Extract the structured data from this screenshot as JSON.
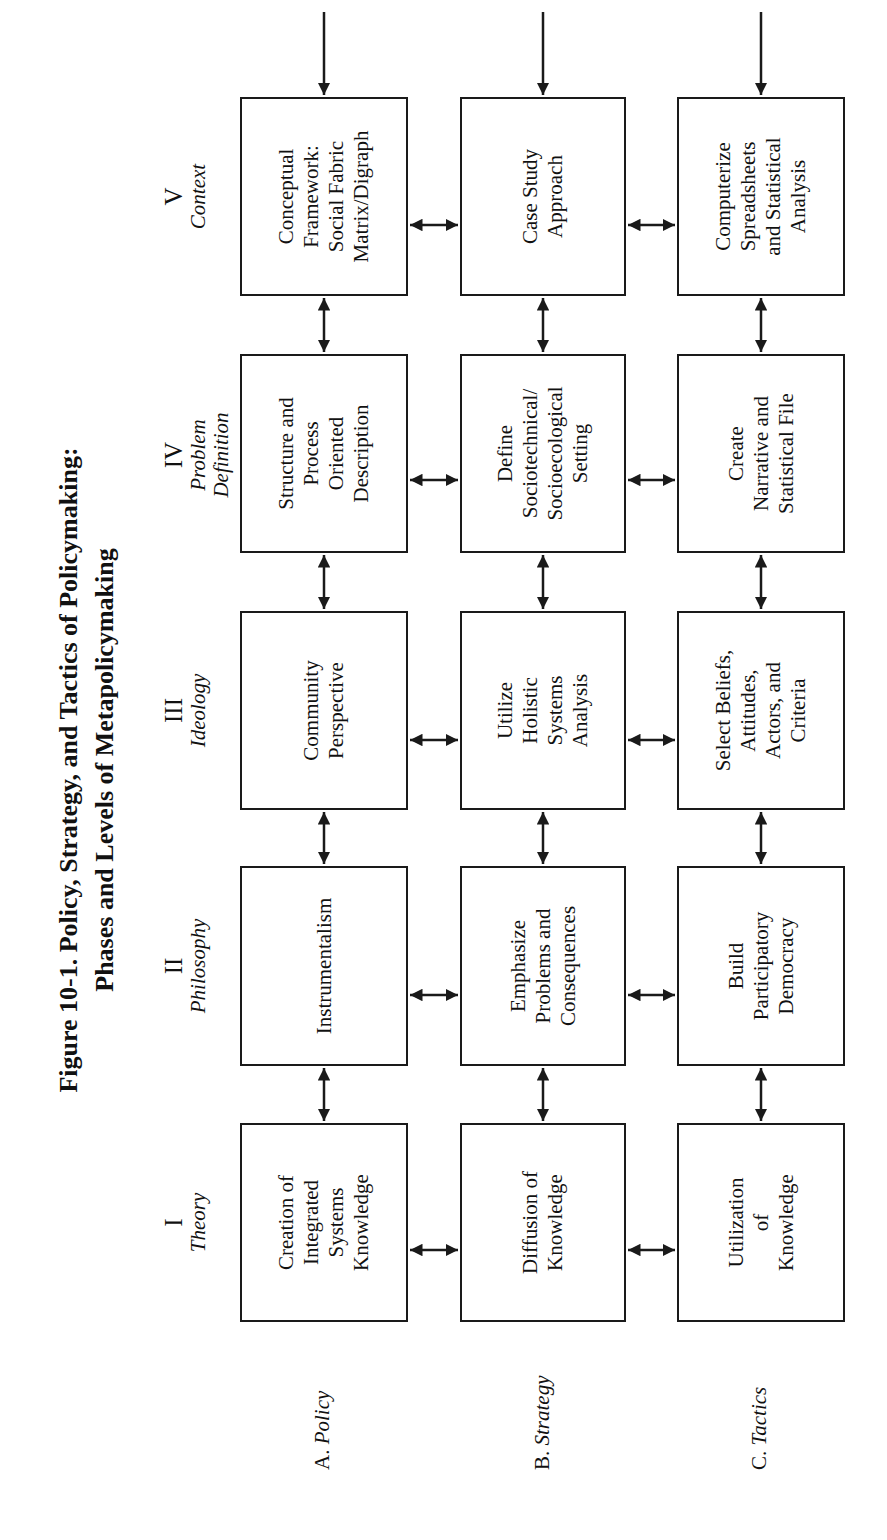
{
  "figure": {
    "title_line1": "Figure 10-1.  Policy, Strategy, and Tactics of Policymaking:",
    "title_line2": "Phases and Levels of Metapolicymaking"
  },
  "phases": [
    {
      "numeral": "I",
      "name": "Theory"
    },
    {
      "numeral": "II",
      "name": "Philosophy"
    },
    {
      "numeral": "III",
      "name": "Ideology"
    },
    {
      "numeral": "IV",
      "name": "Problem Definition"
    },
    {
      "numeral": "V",
      "name": "Context"
    }
  ],
  "levels": [
    {
      "letter": "A.",
      "name": "Policy"
    },
    {
      "letter": "B.",
      "name": "Strategy"
    },
    {
      "letter": "C.",
      "name": "Tactics"
    }
  ],
  "cells": {
    "policy": [
      "Creation of\nIntegrated\nSystems\nKnowledge",
      "Instrumentalism",
      "Community\nPerspective",
      "Structure and\nProcess\nOriented\nDescription",
      "Conceptual\nFramework:\nSocial Fabric\nMatrix/Digraph"
    ],
    "strategy": [
      "Diffusion of\nKnowledge",
      "Emphasize\nProblems and\nConsequences",
      "Utilize\nHolistic\nSystems\nAnalysis",
      "Define\nSociotechnical/\nSocioecological\nSetting",
      "Case Study\nApproach"
    ],
    "tactics": [
      "Utilization\nof\nKnowledge",
      "Build\nParticipatory\nDemocracy",
      "Select Beliefs,\nAttitudes,\nActors, and\nCriteria",
      "Create\nNarrative and\nStatistical File",
      "Computerize\nSpreadsheets\nand Statistical\nAnalysis"
    ]
  },
  "colors": {
    "stroke": "#1a1a1a",
    "background": "#ffffff"
  }
}
